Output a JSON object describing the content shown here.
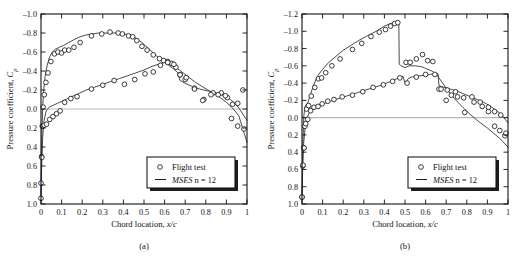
{
  "figure": {
    "panels": [
      {
        "id": "a",
        "caption": "(a)",
        "legend": {
          "marker_label": "Flight test",
          "line_label_italic": "MSES",
          "line_label_rest": " n = 12"
        },
        "chart_data": {
          "type": "line",
          "title": "",
          "xlabel_plain": "Chord location, ",
          "xlabel_italic": "x/c",
          "ylabel_plain": "Pressure coefficient, ",
          "ylabel_italic": "Cp",
          "xlim": [
            0,
            1
          ],
          "ylim": [
            -1.0,
            1.0
          ],
          "y_inverted": true,
          "grid": false,
          "zero_reference_line": 0.0,
          "xticks": [
            0,
            0.1,
            0.2,
            0.3,
            0.4,
            0.5,
            0.6,
            0.7,
            0.8,
            0.9,
            1
          ],
          "xticklabels": [
            "0",
            "0.1",
            "0.2",
            "0.3",
            "0.4",
            "0.5",
            "0.6",
            "0.7",
            "0.8",
            "0.9",
            "1"
          ],
          "yticks": [
            -1.0,
            -0.8,
            -0.6,
            -0.4,
            -0.2,
            0.0,
            0.2,
            0.4,
            0.6,
            0.8,
            1.0
          ],
          "yticklabels": [
            "–1.0",
            "–0.8",
            "–0.6",
            "–0.4",
            "–0.2",
            "0.0",
            "0.2",
            "0.4",
            "0.6",
            "0.8",
            "1.0"
          ],
          "legend_position": "lower right",
          "series": [
            {
              "name": "MSES n = 12 upper surface",
              "kind": "line",
              "x": [
                0.0,
                0.002,
                0.005,
                0.009,
                0.014,
                0.02,
                0.03,
                0.042,
                0.055,
                0.07,
                0.09,
                0.11,
                0.135,
                0.16,
                0.19,
                0.22,
                0.25,
                0.28,
                0.31,
                0.34,
                0.37,
                0.4,
                0.43,
                0.45,
                0.47,
                0.49,
                0.51,
                0.53,
                0.55,
                0.57,
                0.585,
                0.6,
                0.62,
                0.645,
                0.665,
                0.675,
                0.7,
                0.73,
                0.77,
                0.81,
                0.85,
                0.89,
                0.92,
                0.95,
                0.97,
                1.0
              ],
              "y": [
                0.95,
                0.55,
                0.2,
                -0.05,
                -0.22,
                -0.34,
                -0.46,
                -0.55,
                -0.6,
                -0.63,
                -0.65,
                -0.67,
                -0.7,
                -0.73,
                -0.76,
                -0.78,
                -0.79,
                -0.8,
                -0.8,
                -0.8,
                -0.8,
                -0.79,
                -0.78,
                -0.76,
                -0.73,
                -0.7,
                -0.66,
                -0.62,
                -0.58,
                -0.54,
                -0.51,
                -0.49,
                -0.46,
                -0.42,
                -0.38,
                -0.3,
                -0.27,
                -0.24,
                -0.21,
                -0.19,
                -0.17,
                -0.14,
                -0.1,
                -0.04,
                0.02,
                0.12
              ]
            },
            {
              "name": "MSES n = 12 lower surface",
              "kind": "line",
              "x": [
                0.0,
                0.003,
                0.008,
                0.015,
                0.025,
                0.04,
                0.06,
                0.08,
                0.11,
                0.14,
                0.18,
                0.22,
                0.26,
                0.3,
                0.34,
                0.38,
                0.42,
                0.46,
                0.5,
                0.54,
                0.57,
                0.6,
                0.63,
                0.66,
                0.69,
                0.72,
                0.75,
                0.78,
                0.81,
                0.84,
                0.87,
                0.9,
                0.93,
                0.96,
                1.0
              ],
              "y": [
                0.95,
                0.62,
                0.3,
                0.12,
                0.02,
                -0.02,
                -0.04,
                -0.06,
                -0.09,
                -0.12,
                -0.16,
                -0.2,
                -0.23,
                -0.26,
                -0.29,
                -0.32,
                -0.35,
                -0.38,
                -0.41,
                -0.45,
                -0.47,
                -0.49,
                -0.47,
                -0.43,
                -0.38,
                -0.33,
                -0.28,
                -0.24,
                -0.2,
                -0.16,
                -0.12,
                -0.07,
                -0.01,
                0.07,
                0.35
              ]
            },
            {
              "name": "Flight test upper surface",
              "kind": "scatter",
              "x": [
                0.0,
                0.003,
                0.006,
                0.01,
                0.016,
                0.024,
                0.034,
                0.048,
                0.065,
                0.082,
                0.1,
                0.115,
                0.135,
                0.16,
                0.19,
                0.245,
                0.295,
                0.335,
                0.375,
                0.395,
                0.425,
                0.445,
                0.465,
                0.49,
                0.515,
                0.545,
                0.575,
                0.595,
                0.615,
                0.635,
                0.655,
                0.675,
                0.7,
                0.745,
                0.79,
                0.835,
                0.875,
                0.905,
                0.93,
                0.955,
                0.98
              ],
              "y": [
                0.94,
                0.5,
                0.18,
                -0.02,
                -0.15,
                -0.28,
                -0.38,
                -0.5,
                -0.58,
                -0.6,
                -0.59,
                -0.62,
                -0.62,
                -0.65,
                -0.7,
                -0.77,
                -0.79,
                -0.81,
                -0.8,
                -0.79,
                -0.77,
                -0.76,
                -0.72,
                -0.66,
                -0.62,
                -0.57,
                -0.53,
                -0.51,
                -0.5,
                -0.48,
                -0.44,
                -0.36,
                -0.31,
                -0.22,
                -0.1,
                -0.17,
                -0.17,
                -0.12,
                -0.05,
                -0.06,
                -0.2
              ]
            },
            {
              "name": "Flight test lower surface",
              "kind": "scatter",
              "x": [
                0.0,
                0.004,
                0.009,
                0.016,
                0.027,
                0.042,
                0.058,
                0.075,
                0.093,
                0.115,
                0.145,
                0.175,
                0.245,
                0.3,
                0.355,
                0.405,
                0.455,
                0.505,
                0.545,
                0.58,
                0.615,
                0.645,
                0.675,
                0.705,
                0.745,
                0.785,
                0.825,
                0.86,
                0.895,
                0.925,
                0.955,
                0.985
              ],
              "y": [
                0.78,
                0.51,
                0.18,
                0.17,
                0.16,
                0.11,
                0.08,
                0.05,
                0.02,
                -0.07,
                -0.11,
                -0.13,
                -0.21,
                -0.25,
                -0.3,
                -0.26,
                -0.31,
                -0.37,
                -0.39,
                -0.46,
                -0.49,
                -0.47,
                -0.36,
                -0.33,
                -0.21,
                -0.09,
                -0.15,
                -0.15,
                -0.14,
                0.1,
                0.18,
                0.21
              ]
            }
          ]
        }
      },
      {
        "id": "b",
        "caption": "(b)",
        "legend": {
          "marker_label": "Flight test",
          "line_label_italic": "MSES",
          "line_label_rest": " n = 12"
        },
        "chart_data": {
          "type": "line",
          "title": "",
          "xlabel_plain": "Chord location, ",
          "xlabel_italic": "x/c",
          "ylabel_plain": "Pressure coefficient, ",
          "ylabel_italic": "Cp",
          "xlim": [
            0,
            1
          ],
          "ylim": [
            -1.2,
            1.0
          ],
          "y_inverted": true,
          "grid": false,
          "zero_reference_line": 0.0,
          "xticks": [
            0,
            0.1,
            0.2,
            0.3,
            0.4,
            0.5,
            0.6,
            0.7,
            0.8,
            0.9,
            1
          ],
          "xticklabels": [
            "0",
            "0.1",
            "0.2",
            "0.3",
            "0.4",
            "0.5",
            "0.6",
            "0.7",
            "0.8",
            "0.9",
            "1"
          ],
          "yticks": [
            -1.2,
            -1.0,
            -0.8,
            -0.6,
            -0.4,
            -0.2,
            0.0,
            0.2,
            0.4,
            0.6,
            0.8,
            1.0
          ],
          "yticklabels": [
            "–1.2",
            "–1.0",
            "–0.8",
            "–0.6",
            "–0.4",
            "–0.2",
            "0.0",
            "0.2",
            "0.4",
            "0.6",
            "0.8",
            "1.0"
          ],
          "legend_position": "lower right",
          "shock_location": 0.47,
          "series": [
            {
              "name": "MSES n = 12 upper surface",
              "kind": "line",
              "x": [
                0.0,
                0.002,
                0.005,
                0.009,
                0.014,
                0.02,
                0.028,
                0.04,
                0.055,
                0.075,
                0.1,
                0.13,
                0.16,
                0.2,
                0.24,
                0.28,
                0.32,
                0.36,
                0.4,
                0.43,
                0.45,
                0.465,
                0.47,
                0.472,
                0.48,
                0.5,
                0.52,
                0.55,
                0.58,
                0.6,
                0.63,
                0.655,
                0.665,
                0.7,
                0.74,
                0.78,
                0.82,
                0.86,
                0.9,
                0.93,
                0.96,
                1.0
              ],
              "y": [
                0.95,
                0.6,
                0.25,
                -0.02,
                -0.12,
                -0.15,
                -0.17,
                -0.26,
                -0.37,
                -0.48,
                -0.56,
                -0.64,
                -0.7,
                -0.78,
                -0.84,
                -0.9,
                -0.95,
                -1.0,
                -1.06,
                -1.09,
                -1.1,
                -1.1,
                -1.09,
                -0.62,
                -0.6,
                -0.58,
                -0.6,
                -0.6,
                -0.59,
                -0.57,
                -0.54,
                -0.5,
                -0.46,
                -0.34,
                -0.22,
                -0.12,
                -0.03,
                0.05,
                0.12,
                0.18,
                0.24,
                0.34
              ]
            },
            {
              "name": "MSES n = 12 lower surface",
              "kind": "line",
              "x": [
                0.0,
                0.003,
                0.008,
                0.015,
                0.025,
                0.04,
                0.06,
                0.085,
                0.115,
                0.15,
                0.19,
                0.23,
                0.27,
                0.31,
                0.35,
                0.39,
                0.43,
                0.46,
                0.49,
                0.5,
                0.515,
                0.53,
                0.56,
                0.59,
                0.62,
                0.645,
                0.66,
                0.665,
                0.69,
                0.72,
                0.75,
                0.78,
                0.81,
                0.85,
                0.88,
                0.91,
                0.94,
                0.97,
                1.0
              ],
              "y": [
                0.95,
                0.62,
                0.3,
                0.12,
                0.0,
                -0.08,
                -0.12,
                -0.14,
                -0.17,
                -0.2,
                -0.23,
                -0.26,
                -0.29,
                -0.32,
                -0.35,
                -0.38,
                -0.42,
                -0.45,
                -0.48,
                -0.4,
                -0.45,
                -0.47,
                -0.48,
                -0.49,
                -0.5,
                -0.51,
                -0.51,
                -0.37,
                -0.35,
                -0.33,
                -0.31,
                -0.28,
                -0.25,
                -0.21,
                -0.18,
                -0.14,
                -0.09,
                -0.03,
                0.06
              ]
            },
            {
              "name": "Flight test upper surface",
              "kind": "scatter",
              "x": [
                0.0,
                0.004,
                0.008,
                0.014,
                0.022,
                0.032,
                0.045,
                0.062,
                0.08,
                0.095,
                0.115,
                0.145,
                0.185,
                0.245,
                0.29,
                0.335,
                0.375,
                0.405,
                0.43,
                0.45,
                0.465,
                0.505,
                0.525,
                0.555,
                0.585,
                0.61,
                0.635,
                0.665,
                0.7,
                0.725,
                0.755,
                0.79,
                0.835,
                0.875,
                0.905,
                0.935,
                0.96,
                0.985
              ],
              "y": [
                0.92,
                0.56,
                0.35,
                0.1,
                -0.1,
                -0.14,
                -0.25,
                -0.35,
                -0.45,
                -0.46,
                -0.52,
                -0.6,
                -0.68,
                -0.79,
                -0.86,
                -0.94,
                -0.99,
                -1.02,
                -1.06,
                -1.09,
                -1.1,
                -0.64,
                -0.64,
                -0.68,
                -0.73,
                -0.66,
                -0.65,
                -0.33,
                -0.2,
                -0.26,
                -0.24,
                -0.06,
                -0.18,
                -0.13,
                -0.07,
                0.1,
                0.15,
                0.21
              ]
            },
            {
              "name": "Flight test lower surface",
              "kind": "scatter",
              "x": [
                0.0,
                0.005,
                0.01,
                0.018,
                0.028,
                0.042,
                0.058,
                0.078,
                0.098,
                0.125,
                0.155,
                0.195,
                0.245,
                0.295,
                0.345,
                0.395,
                0.44,
                0.475,
                0.51,
                0.555,
                0.6,
                0.645,
                0.675,
                0.705,
                0.745,
                0.785,
                0.825,
                0.865,
                0.905,
                0.935,
                0.965,
                0.99
              ],
              "y": [
                0.92,
                0.55,
                0.35,
                0.07,
                0.02,
                -0.08,
                -0.12,
                -0.13,
                -0.16,
                -0.19,
                -0.21,
                -0.24,
                -0.26,
                -0.3,
                -0.35,
                -0.38,
                -0.42,
                -0.46,
                -0.4,
                -0.47,
                -0.5,
                -0.5,
                -0.33,
                -0.32,
                -0.3,
                -0.23,
                -0.24,
                -0.18,
                -0.12,
                -0.07,
                -0.03,
                0.18
              ]
            }
          ]
        }
      }
    ]
  }
}
